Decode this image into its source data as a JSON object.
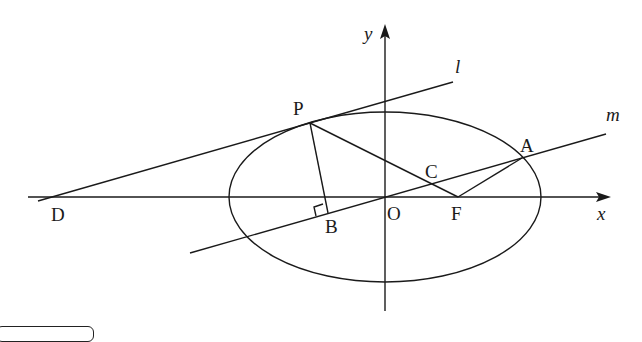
{
  "diagram": {
    "type": "ellipse-geometry",
    "axes": {
      "x_label": "x",
      "y_label": "y",
      "origin_label": "O"
    },
    "points": {
      "P": "P",
      "A": "A",
      "B": "B",
      "C": "C",
      "D": "D",
      "F": "F",
      "O": "O"
    },
    "lines": {
      "l": "l",
      "m": "m"
    },
    "colors": {
      "stroke": "#1a1a1a",
      "background": "#ffffff"
    }
  }
}
